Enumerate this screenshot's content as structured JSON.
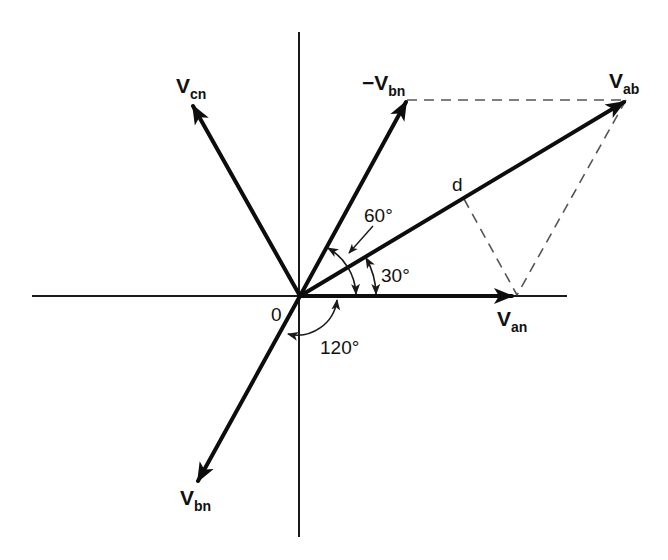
{
  "diagram": {
    "type": "phasor-diagram",
    "origin_label": "0",
    "phasors": [
      {
        "id": "V_an",
        "main": "V",
        "sub": "an",
        "angle_deg": 0
      },
      {
        "id": "V_ab",
        "main": "V",
        "sub": "ab",
        "angle_deg": 30
      },
      {
        "id": "-V_bn",
        "main": "−V",
        "sub": "bn",
        "angle_deg": 60
      },
      {
        "id": "V_cn",
        "main": "V",
        "sub": "cn",
        "angle_deg": 120
      },
      {
        "id": "V_bn",
        "main": "V",
        "sub": "bn",
        "angle_deg": -120
      }
    ],
    "point_label": "d",
    "angles": [
      {
        "id": "angle-60",
        "label": "60°"
      },
      {
        "id": "angle-30",
        "label": "30°"
      },
      {
        "id": "angle-120",
        "label": "120°"
      }
    ],
    "colors": {
      "ink": "#0d0d0d",
      "dashed": "#555555",
      "background": "#ffffff"
    }
  }
}
